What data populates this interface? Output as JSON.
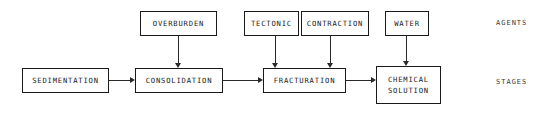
{
  "diagram": {
    "title": "",
    "type": "flow-diagram",
    "row_labels": {
      "agents": "AGENTS",
      "stages": "STAGES"
    },
    "agents": [
      {
        "id": "overburden",
        "label": "OVERBURDEN"
      },
      {
        "id": "tectonic",
        "label": "TECTONIC"
      },
      {
        "id": "contraction",
        "label": "CONTRACTION"
      },
      {
        "id": "water",
        "label": "WATER"
      }
    ],
    "stages": [
      {
        "id": "sedimentation",
        "label": "SEDIMENTATION"
      },
      {
        "id": "consolidation",
        "label": "CONSOLIDATION"
      },
      {
        "id": "fracturation",
        "label": "FRACTURATION"
      },
      {
        "id": "chemical",
        "label_line1": "CHEMICAL",
        "label_line2": "SOLUTION"
      }
    ],
    "edges": [
      {
        "from": "sedimentation",
        "to": "consolidation",
        "direction": "right"
      },
      {
        "from": "consolidation",
        "to": "fracturation",
        "direction": "right"
      },
      {
        "from": "fracturation",
        "to": "chemical",
        "direction": "right"
      },
      {
        "from": "overburden",
        "to": "consolidation",
        "direction": "down"
      },
      {
        "from": "tectonic",
        "to": "fracturation",
        "direction": "down"
      },
      {
        "from": "contraction",
        "to": "fracturation",
        "direction": "down"
      },
      {
        "from": "water",
        "to": "chemical",
        "direction": "down"
      }
    ],
    "colors": {
      "background": "#ffffff",
      "stroke": "#1a1a1a",
      "text": "#1c1c1c",
      "label_text": "#3a3a3a"
    }
  }
}
